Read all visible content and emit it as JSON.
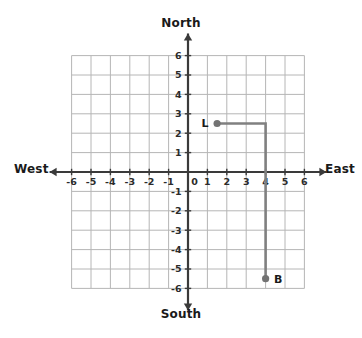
{
  "compass": {
    "north": "North",
    "south": "South",
    "west": "West",
    "east": "East"
  },
  "colors": {
    "grid_line": "#b6b6b6",
    "axis_line": "#3a3a3a",
    "path_line": "#808080",
    "point_fill": "#737373",
    "label_text": "#1a1a1a",
    "background": "#ffffff"
  },
  "chart_data": {
    "type": "scatter",
    "title": "",
    "xlabel": "",
    "ylabel": "",
    "xlim": [
      -6,
      6
    ],
    "ylim": [
      -6,
      6
    ],
    "grid": true,
    "legend": null,
    "x_tick_labels": [
      "-6",
      "-5",
      "-4",
      "-3",
      "-2",
      "-1",
      "0",
      "1",
      "2",
      "3",
      "4",
      "5",
      "6"
    ],
    "y_tick_labels": [
      "-6",
      "-5",
      "-4",
      "-3",
      "-2",
      "-1",
      "1",
      "2",
      "3",
      "4",
      "5",
      "6"
    ],
    "x_ticks": [
      -6,
      -5,
      -4,
      -3,
      -2,
      -1,
      0,
      1,
      2,
      3,
      4,
      5,
      6
    ],
    "y_ticks": [
      -6,
      -5,
      -4,
      -3,
      -2,
      -1,
      1,
      2,
      3,
      4,
      5,
      6
    ],
    "origin_label": "0",
    "points": [
      {
        "label": "L",
        "x": 1.5,
        "y": 2.5,
        "label_side": "left"
      },
      {
        "label": "B",
        "x": 4,
        "y": -5.5,
        "label_side": "right"
      }
    ],
    "path": {
      "name": "route-L-to-B",
      "vertices": [
        {
          "x": 1.5,
          "y": 2.5
        },
        {
          "x": 4,
          "y": 2.5
        },
        {
          "x": 4,
          "y": -5.5
        }
      ]
    }
  }
}
